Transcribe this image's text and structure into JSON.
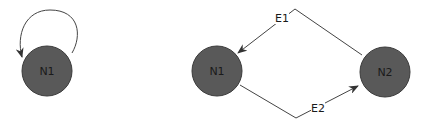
{
  "diagrams": [
    {
      "id": "self-loop",
      "nodes": [
        {
          "id": "n1",
          "label": "N1"
        }
      ],
      "edges": [
        {
          "from": "n1",
          "to": "n1",
          "label": "",
          "type": "self-loop"
        }
      ]
    },
    {
      "id": "two-node-cycle",
      "nodes": [
        {
          "id": "n1",
          "label": "N1"
        },
        {
          "id": "n2",
          "label": "N2"
        }
      ],
      "edges": [
        {
          "from": "n2",
          "to": "n1",
          "label": "E1"
        },
        {
          "from": "n1",
          "to": "n2",
          "label": "E2"
        }
      ]
    }
  ],
  "colors": {
    "node_fill": "#595959",
    "edge": "#444444",
    "background": "#ffffff"
  }
}
